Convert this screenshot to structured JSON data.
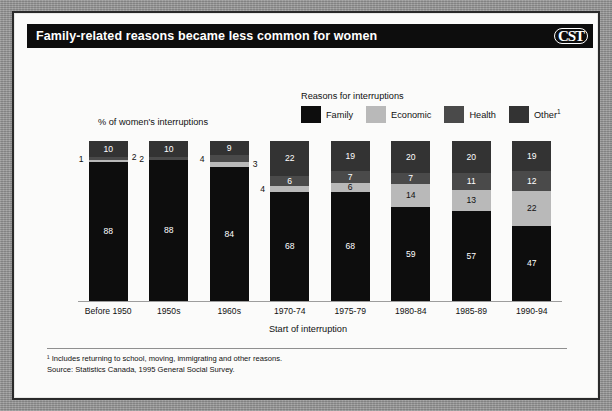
{
  "header": {
    "title": "Family-related reasons became less common for women",
    "logo": "CST"
  },
  "legend": {
    "title": "Reasons for interruptions",
    "items": [
      {
        "label": "Family",
        "color": "#0d0d0d"
      },
      {
        "label": "Economic",
        "color": "#b9b9b9"
      },
      {
        "label": "Health",
        "color": "#4a4a4a"
      },
      {
        "label": "Other",
        "superscript": "1",
        "color": "#333333"
      }
    ]
  },
  "axes": {
    "ylabel": "% of women's interruptions",
    "xlabel": "Start of interruption"
  },
  "notes": {
    "footnote": "¹ Includes returning to school, moving, immigrating and other reasons.",
    "source": "Source: Statistics Canada, 1995 General Social Survey."
  },
  "chart_data": {
    "type": "bar",
    "stacked": true,
    "title": "Family-related reasons became less common for women",
    "xlabel": "Start of interruption",
    "ylabel": "% of women's interruptions",
    "ylim": [
      0,
      100
    ],
    "grid": false,
    "legend_position": "top-right",
    "categories": [
      "Before 1950",
      "1950s",
      "1960s",
      "1970-74",
      "1975-79",
      "1980-84",
      "1985-89",
      "1990-94"
    ],
    "series": [
      {
        "name": "Family",
        "color": "#0d0d0d",
        "values": [
          88,
          88,
          84,
          68,
          68,
          59,
          57,
          47
        ]
      },
      {
        "name": "Economic",
        "color": "#b9b9b9",
        "values": [
          1,
          0,
          3,
          4,
          6,
          14,
          13,
          22
        ]
      },
      {
        "name": "Health",
        "color": "#4a4a4a",
        "values": [
          2,
          2,
          4,
          6,
          7,
          7,
          11,
          12
        ]
      },
      {
        "name": "Other",
        "color": "#333333",
        "values": [
          10,
          10,
          9,
          22,
          19,
          20,
          20,
          19
        ]
      }
    ],
    "labels_inside": {
      "Before 1950": {
        "Family": "88",
        "Other": "10"
      },
      "1950s": {
        "Family": "88",
        "Other": "10"
      },
      "1960s": {
        "Family": "84",
        "Other": "9"
      },
      "1970-74": {
        "Family": "68",
        "Health": "6",
        "Other": "22"
      },
      "1975-79": {
        "Family": "68",
        "Economic": "6",
        "Health": "7",
        "Other": "19"
      },
      "1980-84": {
        "Family": "59",
        "Economic": "14",
        "Health": "7",
        "Other": "20"
      },
      "1985-89": {
        "Family": "57",
        "Economic": "13",
        "Health": "11",
        "Other": "20"
      },
      "1990-94": {
        "Family": "47",
        "Economic": "22",
        "Health": "12",
        "Other": "19"
      }
    },
    "labels_outside": [
      {
        "text": "1",
        "category": "Before 1950",
        "series": "Economic",
        "side": "left"
      },
      {
        "text": "2",
        "category": "Before 1950",
        "series": "Health",
        "side": "right"
      },
      {
        "text": "2",
        "category": "1950s",
        "series": "Health",
        "side": "left"
      },
      {
        "text": "4",
        "category": "1960s",
        "series": "Health",
        "side": "left"
      },
      {
        "text": "3",
        "category": "1960s",
        "series": "Economic",
        "side": "right"
      },
      {
        "text": "4",
        "category": "1970-74",
        "series": "Economic",
        "side": "left"
      }
    ]
  }
}
